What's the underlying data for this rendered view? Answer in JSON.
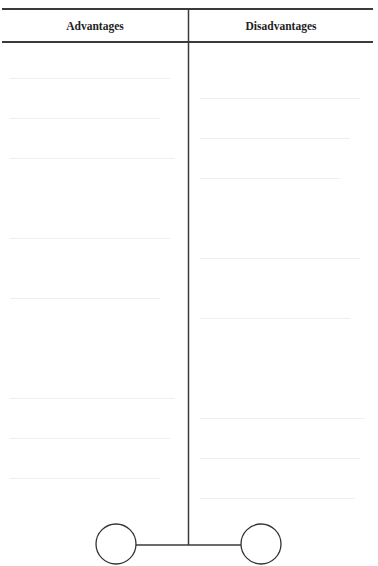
{
  "document": {
    "type": "two-column comparison table",
    "table": {
      "columns": [
        {
          "header": "Advantages",
          "cells": []
        },
        {
          "header": "Disadvantages",
          "cells": []
        }
      ]
    },
    "diagram": {
      "shape": "T-bar with two circles (balance/scale sketch)",
      "left_circle": {
        "cx": 116,
        "cy": 544,
        "r": 20
      },
      "right_circle": {
        "cx": 261,
        "cy": 544,
        "r": 20
      },
      "divider_x": 188,
      "crossbar_y": 545
    },
    "colors": {
      "line": "#3a3a3a",
      "background": "#ffffff"
    }
  }
}
